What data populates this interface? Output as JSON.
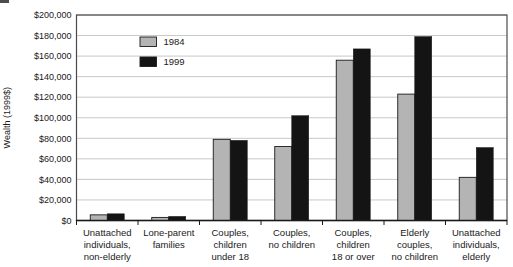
{
  "chart_data": {
    "type": "bar",
    "title": "",
    "ylabel": "Wealth (1999$)",
    "xlabel": "",
    "ylim": [
      0,
      200000
    ],
    "ytick_step": 20000,
    "ytick_labels": [
      "$0",
      "$20,000",
      "$40,000",
      "$60,000",
      "$80,000",
      "$100,000",
      "$120,000",
      "$140,000",
      "$160,000",
      "$180,000",
      "$200,000"
    ],
    "grid": true,
    "legend_position": "top-left-inside",
    "categories": [
      {
        "label": "Unattached individuals, non-elderly",
        "lines": [
          "Unattached",
          "individuals,",
          "non-elderly"
        ]
      },
      {
        "label": "Lone-parent families",
        "lines": [
          "Lone-parent",
          "families"
        ]
      },
      {
        "label": "Couples, children under 18",
        "lines": [
          "Couples,",
          "children",
          "under 18"
        ]
      },
      {
        "label": "Couples, no children",
        "lines": [
          "Couples,",
          "no children"
        ]
      },
      {
        "label": "Couples, children 18 or over",
        "lines": [
          "Couples,",
          "children",
          "18 or over"
        ]
      },
      {
        "label": "Elderly couples, no children",
        "lines": [
          "Elderly",
          "couples,",
          "no children"
        ]
      },
      {
        "label": "Unattached individuals, elderly",
        "lines": [
          "Unattached",
          "individuals,",
          "elderly"
        ]
      }
    ],
    "series": [
      {
        "name": "1984",
        "color": "#b4b4b4",
        "values": [
          5500,
          3000,
          79000,
          72000,
          156000,
          123000,
          42000
        ]
      },
      {
        "name": "1999",
        "color": "#141414",
        "values": [
          6500,
          4000,
          78000,
          102000,
          167000,
          179000,
          71000
        ]
      }
    ]
  },
  "colors": {
    "background": "#ffffff",
    "grid": "#c8c8c8",
    "frame": "#4a4a4a",
    "axis": "#1a1a1a",
    "text": "#1a1a1a",
    "bar_1984": "#b4b4b4",
    "bar_1999": "#141414"
  }
}
